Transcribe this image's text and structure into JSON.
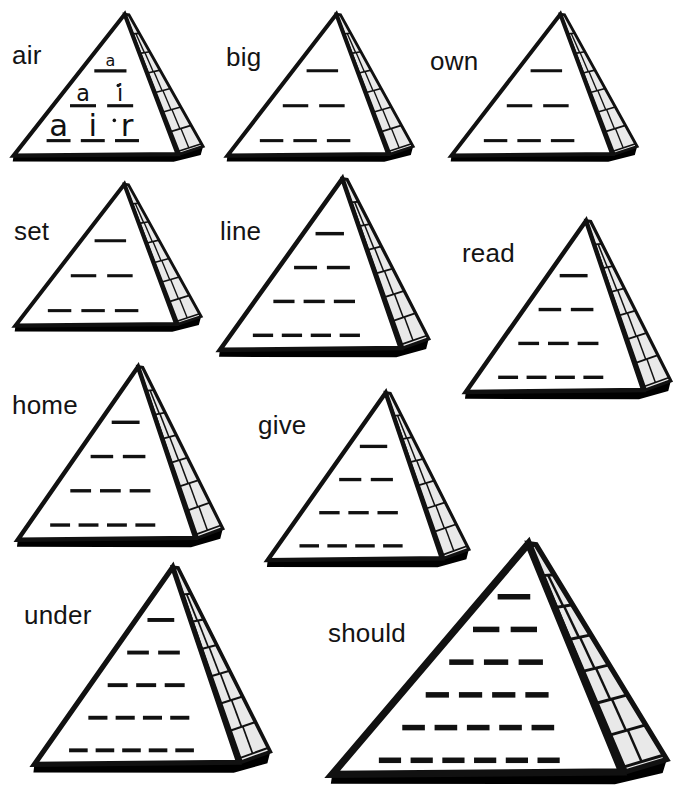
{
  "worksheet": {
    "title": "Word Pyramids",
    "background_color": "#ffffff",
    "ink_color": "#111111",
    "brick_fill_color": "#e9e9e9",
    "brick_line_color": "#111111",
    "shadow_color": "#000000"
  },
  "pyramids": [
    {
      "id": "air",
      "label": "air",
      "rows": 3,
      "filled": true,
      "filled_rows": [
        [
          "a"
        ],
        [
          "a",
          "i"
        ],
        [
          "a",
          "i",
          "r"
        ]
      ],
      "x": 10,
      "y": 12,
      "width": 196,
      "height": 152,
      "label_x": 12,
      "label_y": 42,
      "label_size": 26
    },
    {
      "id": "big",
      "label": "big",
      "rows": 3,
      "filled": false,
      "filled_rows": [],
      "x": 224,
      "y": 12,
      "width": 192,
      "height": 152,
      "label_x": 226,
      "label_y": 44,
      "label_size": 26
    },
    {
      "id": "own",
      "label": "own",
      "rows": 3,
      "filled": false,
      "filled_rows": [],
      "x": 448,
      "y": 12,
      "width": 192,
      "height": 152,
      "label_x": 430,
      "label_y": 48,
      "label_size": 26
    },
    {
      "id": "set",
      "label": "set",
      "rows": 3,
      "filled": false,
      "filled_rows": [],
      "x": 12,
      "y": 182,
      "width": 192,
      "height": 152,
      "label_x": 14,
      "label_y": 218,
      "label_size": 26
    },
    {
      "id": "line",
      "label": "line",
      "rows": 4,
      "filled": false,
      "filled_rows": [],
      "x": 216,
      "y": 176,
      "width": 216,
      "height": 184,
      "label_x": 220,
      "label_y": 218,
      "label_size": 26
    },
    {
      "id": "read",
      "label": "read",
      "rows": 4,
      "filled": false,
      "filled_rows": [],
      "x": 462,
      "y": 218,
      "width": 212,
      "height": 184,
      "label_x": 462,
      "label_y": 240,
      "label_size": 26
    },
    {
      "id": "home",
      "label": "home",
      "rows": 4,
      "filled": false,
      "filled_rows": [],
      "x": 14,
      "y": 364,
      "width": 212,
      "height": 186,
      "label_x": 12,
      "label_y": 392,
      "label_size": 26
    },
    {
      "id": "give",
      "label": "give",
      "rows": 4,
      "filled": false,
      "filled_rows": [],
      "x": 264,
      "y": 390,
      "width": 208,
      "height": 180,
      "label_x": 258,
      "label_y": 412,
      "label_size": 26
    },
    {
      "id": "under",
      "label": "under",
      "rows": 5,
      "filled": false,
      "filled_rows": [],
      "x": 30,
      "y": 564,
      "width": 244,
      "height": 212,
      "label_x": 24,
      "label_y": 602,
      "label_size": 26
    },
    {
      "id": "should",
      "label": "should",
      "rows": 6,
      "filled": false,
      "filled_rows": [],
      "x": 326,
      "y": 540,
      "width": 346,
      "height": 248,
      "label_x": 328,
      "label_y": 620,
      "label_size": 26
    }
  ]
}
